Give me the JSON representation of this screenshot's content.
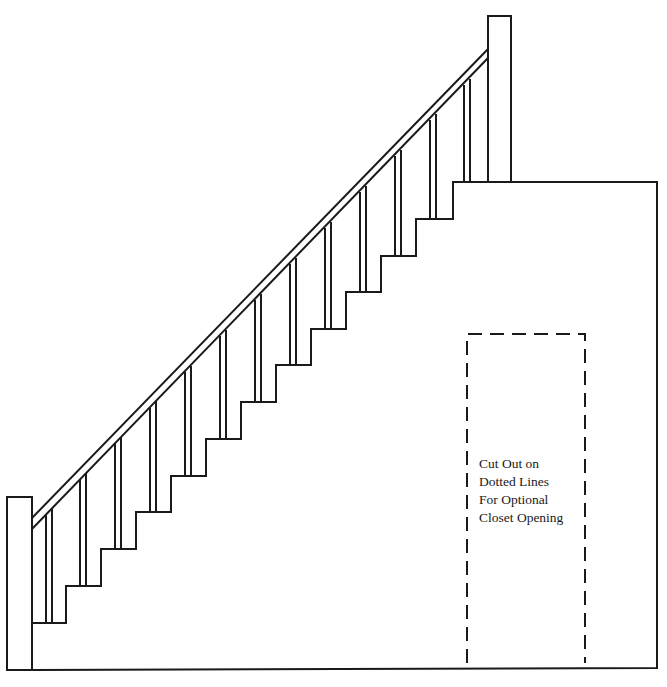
{
  "diagram": {
    "stroke_color": "#1a1a1a",
    "background": "#ffffff",
    "step_count": 12,
    "closet_opening": {
      "style": "dashed",
      "label_lines": [
        "Cut Out on",
        "Dotted Lines",
        "For Optional",
        "Closet Opening"
      ]
    }
  }
}
